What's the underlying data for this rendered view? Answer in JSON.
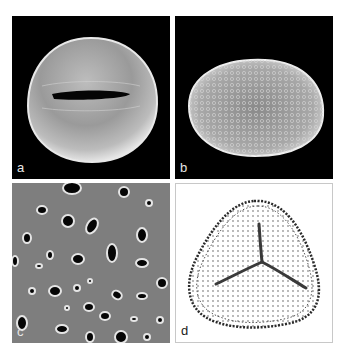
{
  "figure": {
    "panels": [
      {
        "id": "a",
        "label": "a",
        "description": "SEM image of pollen grain with single slit aperture, dark background"
      },
      {
        "id": "b",
        "label": "b",
        "description": "SEM image of ellipsoid reticulate pollen grain, dark background"
      },
      {
        "id": "c",
        "label": "c",
        "description": "Close-up of perforated pollen surface, grey with dark pores"
      },
      {
        "id": "d",
        "label": "d",
        "description": "Light micrograph of triangular trilete spore on white background"
      }
    ]
  },
  "colors": {
    "background": "#ffffff",
    "sem_background": "#000000",
    "surface_grey": "#808080",
    "grain_highlight": "#d8d8d8"
  }
}
